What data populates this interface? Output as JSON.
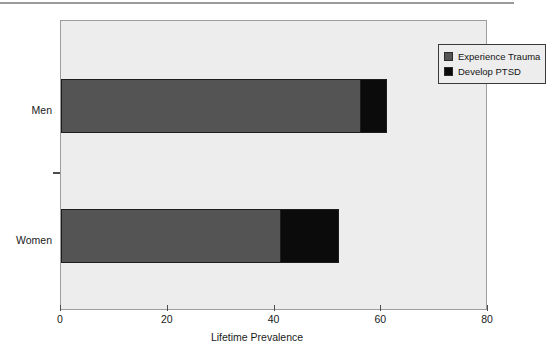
{
  "chart_data": {
    "type": "bar",
    "orientation": "horizontal",
    "stacked": true,
    "title": "",
    "xlabel": "Lifetime Prevalence",
    "ylabel": "",
    "categories": [
      "Men",
      "Women"
    ],
    "series": [
      {
        "name": "Experience Trauma",
        "color": "#545454",
        "values": [
          56,
          41
        ]
      },
      {
        "name": "Develop PTSD",
        "color": "#0b0b0b",
        "values": [
          5,
          11
        ]
      }
    ],
    "cumulative_ends": {
      "Men": {
        "trauma_end": 56,
        "ptsd_end": 61
      },
      "Women": {
        "trauma_end": 41,
        "ptsd_end": 52
      }
    },
    "xlim": [
      0,
      80
    ],
    "xticks": [
      0,
      20,
      40,
      60,
      80
    ],
    "xtick_labels": [
      "0",
      "20",
      "40",
      "60",
      "80"
    ],
    "grid": false,
    "legend_position": "top-right",
    "plot_background": "#ededed"
  },
  "axes": {
    "x": {
      "title": "Lifetime Prevalence",
      "ticks": [
        {
          "value": 0,
          "label": "0"
        },
        {
          "value": 20,
          "label": "20"
        },
        {
          "value": 40,
          "label": "40"
        },
        {
          "value": 60,
          "label": "60"
        },
        {
          "value": 80,
          "label": "80"
        }
      ]
    },
    "y": {
      "categories": [
        {
          "label": "Men"
        },
        {
          "label": "Women"
        }
      ]
    }
  },
  "legend": {
    "entries": [
      {
        "label": "Experience Trauma",
        "color": "#545454"
      },
      {
        "label": "Develop PTSD",
        "color": "#0b0b0b"
      }
    ]
  }
}
